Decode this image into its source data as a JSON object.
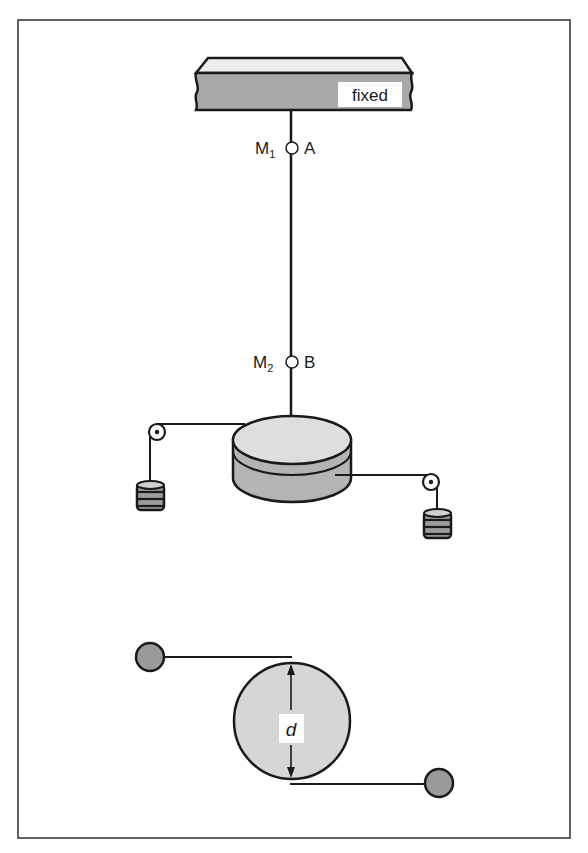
{
  "figure": {
    "type": "torsion-pendulum diagram",
    "labels": {
      "support": "fixed",
      "mark_upper": "M",
      "mark_upper_sub": "1",
      "point_upper": "A",
      "mark_lower": "M",
      "mark_lower_sub": "2",
      "point_lower": "B",
      "diameter": "d"
    },
    "parts": {
      "top_view": "side view: wire suspended from fixed support, cylinder driven by two hanging weights over pulleys",
      "bottom_view": "top view: disc of diameter d with threads leading tangentially to two pulleys"
    },
    "colors": {
      "outline": "#1a1a1a",
      "support_fill": "#a8a8a8",
      "support_top": "#ededed",
      "cylinder_top": "#dedede",
      "cylinder_side": "#b4b4b4",
      "disc_fill": "#d6d6d6",
      "pulley_fill": "#9a9a9a",
      "weight_band": "#9c9c9c",
      "frame": "#3a3a3a"
    }
  }
}
